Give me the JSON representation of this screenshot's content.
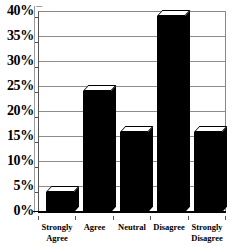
{
  "chart_data": {
    "type": "bar",
    "title": "",
    "subtitle": "",
    "xlabel": "",
    "ylabel": "",
    "categories": [
      "Strongly Agree",
      "Agree",
      "Neutral",
      "Disagree",
      "Strongly Disagree"
    ],
    "values": [
      4,
      24,
      16,
      39,
      16
    ],
    "ylim": [
      0,
      40
    ],
    "ytick_values": [
      0,
      5,
      10,
      15,
      20,
      25,
      30,
      35,
      40
    ],
    "ytick_labels": [
      "0%",
      "5%",
      "10%",
      "15%",
      "20%",
      "25%",
      "30%",
      "35%",
      "40%"
    ],
    "grid": true,
    "legend": false,
    "legend_position": "none",
    "style": "3d-bar",
    "bar_color": "#000000",
    "bar_top_color": "#ffffff",
    "gridline_color": "#8c8c8c",
    "axis_color": "#000000",
    "background_color": "#ffffff"
  },
  "axis": {
    "y_ticks": [
      {
        "label": "40%",
        "value": 40
      },
      {
        "label": "35%",
        "value": 35
      },
      {
        "label": "30%",
        "value": 30
      },
      {
        "label": "25%",
        "value": 25
      },
      {
        "label": "20%",
        "value": 20
      },
      {
        "label": "15%",
        "value": 15
      },
      {
        "label": "10%",
        "value": 10
      },
      {
        "label": "5%",
        "value": 5
      },
      {
        "label": "0%",
        "value": 0
      }
    ],
    "x_categories": [
      {
        "line1": "Strongly",
        "line2": "Agree"
      },
      {
        "line1": "Agree",
        "line2": ""
      },
      {
        "line1": "Neutral",
        "line2": ""
      },
      {
        "line1": "Disagree",
        "line2": ""
      },
      {
        "line1": "Strongly",
        "line2": "Disagree"
      }
    ]
  }
}
